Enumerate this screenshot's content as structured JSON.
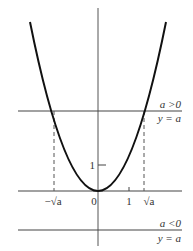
{
  "diagram": {
    "colors": {
      "curve": "#111111",
      "axis": "#555555",
      "line": "#444444",
      "text": "#333333"
    },
    "curve": {
      "equation": "y = x^2",
      "vertex": [
        0,
        0
      ]
    },
    "upper_line": {
      "condition": "a >0",
      "equation": "y = a"
    },
    "lower_line": {
      "condition": "a <0",
      "equation": "y = a"
    },
    "x_axis_labels": {
      "neg_root": "−√a",
      "origin": "0",
      "one": "1",
      "pos_root": "√a"
    },
    "neg_root_prefix": "−",
    "root_symbol": "√",
    "root_var": "a",
    "y_axis_labels": {
      "one": "1"
    }
  }
}
